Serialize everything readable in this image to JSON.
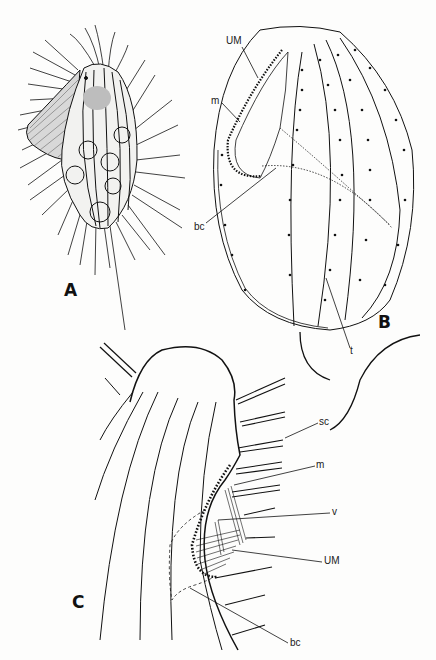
{
  "figure": {
    "panels": [
      {
        "id": "A",
        "label": "A"
      },
      {
        "id": "B",
        "label": "B"
      },
      {
        "id": "C",
        "label": "C"
      }
    ],
    "labels": {
      "B": {
        "um": "UM",
        "m": "m",
        "bc": "bc",
        "t": "t"
      },
      "C": {
        "sc": "sc",
        "m": "m",
        "v": "v",
        "um": "UM",
        "bc": "bc"
      }
    },
    "ink_color": "#111111",
    "paper_color": "#fdfdfc"
  }
}
